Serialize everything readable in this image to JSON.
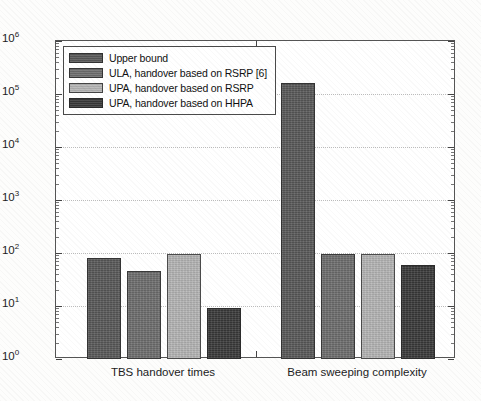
{
  "chart_data": {
    "type": "bar",
    "title": "",
    "xlabel": "",
    "ylabel": "",
    "yscale": "log",
    "ylim": [
      1,
      1000000
    ],
    "grid": true,
    "legend_position": "top-left",
    "categories": [
      "TBS handover times",
      "Beam sweeping complexity"
    ],
    "series": [
      {
        "name": "Upper bound",
        "color": "#595959",
        "values": [
          80,
          160000
        ]
      },
      {
        "name": "ULA, handover based on RSRP [6]",
        "color": "#6e6e6e",
        "values": [
          45,
          95
        ]
      },
      {
        "name": "UPA, handover based on RSRP",
        "color": "#b5b5b5",
        "values": [
          95,
          95
        ]
      },
      {
        "name": "UPA, handover based on HHPA",
        "color": "#3a3a3a",
        "values": [
          9,
          60
        ]
      }
    ],
    "ytick_labels": [
      "10^0",
      "10^1",
      "10^2",
      "10^3",
      "10^4",
      "10^5",
      "10^6"
    ],
    "ytick_values": [
      1,
      10,
      100,
      1000,
      10000,
      100000,
      1000000
    ]
  },
  "axis": {
    "y_ticks": [
      {
        "mantissa": "10",
        "exponent": "6",
        "value": 1000000
      },
      {
        "mantissa": "10",
        "exponent": "5",
        "value": 100000
      },
      {
        "mantissa": "10",
        "exponent": "4",
        "value": 10000
      },
      {
        "mantissa": "10",
        "exponent": "3",
        "value": 1000
      },
      {
        "mantissa": "10",
        "exponent": "2",
        "value": 100
      },
      {
        "mantissa": "10",
        "exponent": "1",
        "value": 10
      },
      {
        "mantissa": "10",
        "exponent": "0",
        "value": 1
      }
    ],
    "x_categories": [
      {
        "label": "TBS handover times"
      },
      {
        "label": "Beam sweeping complexity"
      }
    ]
  },
  "legend": {
    "entries": [
      {
        "label": "Upper bound",
        "color": "#595959"
      },
      {
        "label": "ULA, handover based on RSRP [6]",
        "color": "#6e6e6e"
      },
      {
        "label": "UPA, handover based on RSRP",
        "color": "#b5b5b5"
      },
      {
        "label": "UPA, handover based on HHPA",
        "color": "#3a3a3a"
      }
    ]
  }
}
